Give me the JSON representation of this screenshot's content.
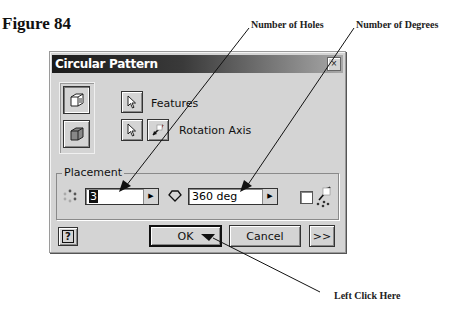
{
  "figure": {
    "title": "Figure 84"
  },
  "callouts": {
    "holes": "Number of Holes",
    "degrees": "Number of Degrees",
    "click": "Left Click Here"
  },
  "dialog": {
    "title": "Circular Pattern",
    "close_icon": "×",
    "features_label": "Features",
    "rotation_axis_label": "Rotation Axis",
    "placement": {
      "legend": "Placement",
      "count_value": "3",
      "angle_value": "360 deg",
      "spin_icon": "▶"
    },
    "buttons": {
      "help": "?",
      "ok": "OK",
      "cancel": "Cancel",
      "more": ">>"
    }
  }
}
